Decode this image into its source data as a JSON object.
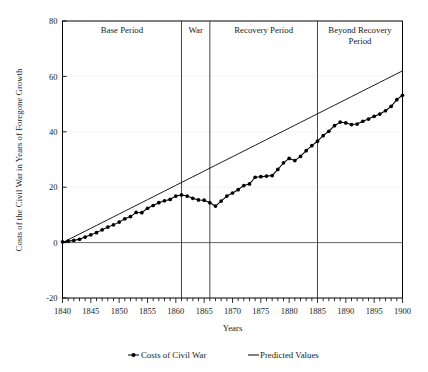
{
  "chart_data": {
    "type": "line",
    "title": "",
    "xlabel": "Years",
    "ylabel": "Costs of the Civil War in Years of Foregone Growth",
    "xlim": [
      1840,
      1900
    ],
    "ylim": [
      -20,
      80
    ],
    "xticks": [
      1840,
      1845,
      1850,
      1855,
      1860,
      1865,
      1870,
      1875,
      1880,
      1885,
      1890,
      1895,
      1900
    ],
    "xtick_labels": [
      "1840",
      "1845",
      "1850",
      "1855",
      "1860",
      "1865",
      "1870",
      "1875",
      "1880",
      "1885",
      "1890",
      "1895",
      "1900"
    ],
    "xtick_minor_step": 1,
    "yticks": [
      -20,
      0,
      20,
      40,
      60,
      80
    ],
    "ytick_labels": [
      "-20",
      "0",
      "20",
      "40",
      "60",
      "80"
    ],
    "grid": "horizontal-faint",
    "legend_position": "bottom",
    "x": [
      1840,
      1841,
      1842,
      1843,
      1844,
      1845,
      1846,
      1847,
      1848,
      1849,
      1850,
      1851,
      1852,
      1853,
      1854,
      1855,
      1856,
      1857,
      1858,
      1859,
      1860,
      1861,
      1862,
      1863,
      1864,
      1865,
      1866,
      1867,
      1868,
      1869,
      1870,
      1871,
      1872,
      1873,
      1874,
      1875,
      1876,
      1877,
      1878,
      1879,
      1880,
      1881,
      1882,
      1883,
      1884,
      1885,
      1886,
      1887,
      1888,
      1889,
      1890,
      1891,
      1892,
      1893,
      1894,
      1895,
      1896,
      1897,
      1898,
      1899,
      1900
    ],
    "series": [
      {
        "name": "Costs of Civil War",
        "marker": "filled-circle",
        "color": "#000000",
        "values": [
          0.3,
          0.5,
          0.8,
          1.2,
          2.0,
          2.8,
          3.6,
          4.6,
          5.6,
          6.4,
          7.4,
          8.6,
          9.4,
          10.9,
          10.8,
          12.4,
          13.4,
          14.4,
          15.1,
          15.6,
          16.8,
          17.2,
          16.8,
          16.0,
          15.4,
          15.3,
          14.4,
          13.2,
          15.0,
          16.8,
          17.9,
          19.1,
          20.6,
          21.2,
          23.6,
          23.8,
          24.0,
          24.2,
          26.4,
          28.8,
          30.4,
          29.6,
          31.1,
          33.2,
          35.0,
          36.6,
          38.6,
          40.2,
          42.2,
          43.5,
          43.2,
          42.6,
          42.8,
          43.8,
          44.6,
          45.6,
          46.4,
          47.6,
          49.2,
          51.6,
          53.2
        ]
      },
      {
        "name": "Predicted Values",
        "marker": "none",
        "color": "#000000",
        "values": [
          0.0,
          1.03,
          2.07,
          3.1,
          4.13,
          5.17,
          6.2,
          7.23,
          8.27,
          9.3,
          10.33,
          11.37,
          12.4,
          13.43,
          14.47,
          15.5,
          16.53,
          17.57,
          18.6,
          19.63,
          20.67,
          21.7,
          22.73,
          23.77,
          24.8,
          25.83,
          26.87,
          27.9,
          28.93,
          29.97,
          31.0,
          32.03,
          33.07,
          34.1,
          35.13,
          36.17,
          37.2,
          38.23,
          39.27,
          40.3,
          41.33,
          42.37,
          43.4,
          44.43,
          45.47,
          46.5,
          47.53,
          48.57,
          49.6,
          50.63,
          51.67,
          52.7,
          53.73,
          54.77,
          55.8,
          56.83,
          57.87,
          58.9,
          59.93,
          60.97,
          62.0
        ]
      }
    ],
    "period_bands": [
      {
        "label": "Base Period",
        "start": 1840,
        "end": 1861
      },
      {
        "label": "War",
        "start": 1861,
        "end": 1866
      },
      {
        "label": "Recovery Period",
        "start": 1866,
        "end": 1885
      },
      {
        "label": "Beyond Recovery Period",
        "start": 1885,
        "end": 1900
      }
    ],
    "divider_years": [
      1861,
      1866,
      1885
    ]
  },
  "legend": {
    "items": [
      {
        "label": "Costs of Civil War",
        "marker": "line-with-point"
      },
      {
        "label": "Predicted Values",
        "marker": "line"
      }
    ]
  },
  "axes": {
    "y_title": "Costs of the Civil War in Years of Foregone Growth",
    "x_title": "Years"
  },
  "colors": {
    "axis": "#000000",
    "grid": "#d9d9d9",
    "series": "#000000",
    "background": "#ffffff"
  }
}
